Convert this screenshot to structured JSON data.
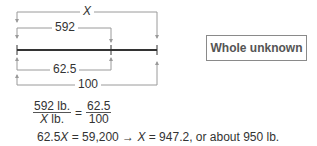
{
  "diagram": {
    "labels": {
      "whole_top": "X",
      "part_top": "592",
      "part_bottom": "62.5",
      "whole_bottom": "100"
    },
    "box_label": "Whole unknown"
  },
  "equation": {
    "fraction_left_num": "592 lb.",
    "fraction_left_den_var": "X",
    "fraction_left_den_unit": " lb.",
    "equals": "=",
    "fraction_right_num": "62.5",
    "fraction_right_den": "100",
    "solution_prefix": "62.5",
    "solution_var1": "X",
    "solution_mid": " = 59,200 → ",
    "solution_var2": "X",
    "solution_end": " = 947.2, or about 950 lb."
  }
}
